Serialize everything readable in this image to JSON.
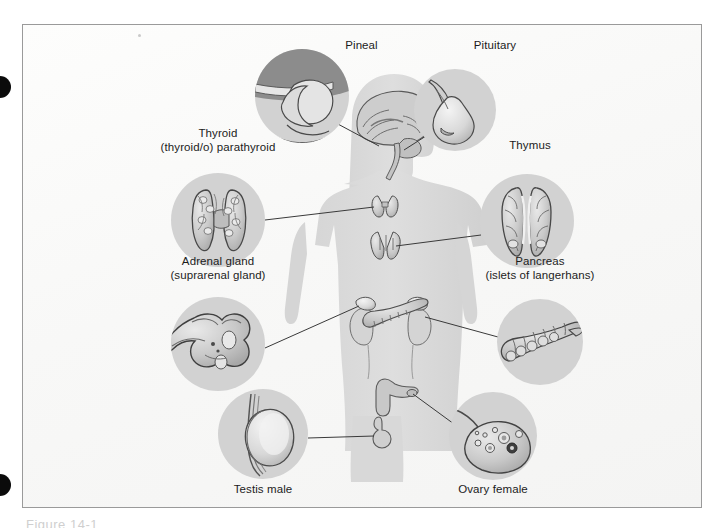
{
  "figure": {
    "bottom_caption_partial": "Figure 14-1",
    "background_color": "#fbfbfa",
    "frame_border_color": "#9a9a9a",
    "body_silhouette_color": "#dcdcdc",
    "callout_circle_color": "#d2d2d2",
    "callout_circle_dark_color": "#8c8c8c",
    "leader_line_color": "#3a3a3a",
    "organ_fill_color": "#c6c6c6",
    "organ_outline_color": "#4a4a4a",
    "label_text_color": "#1c1c1c"
  },
  "labels": [
    {
      "id": "pineal",
      "name": "Pineal",
      "sub": ""
    },
    {
      "id": "pituitary",
      "name": "Pituitary",
      "sub": ""
    },
    {
      "id": "thyroid",
      "name": "Thyroid",
      "sub": "(thyroid/o) parathyroid"
    },
    {
      "id": "thymus",
      "name": "Thymus",
      "sub": ""
    },
    {
      "id": "adrenal",
      "name": "Adrenal gland",
      "sub": "(suprarenal gland)"
    },
    {
      "id": "pancreas",
      "name": "Pancreas",
      "sub": "(islets of langerhans)"
    },
    {
      "id": "testis",
      "name": "Testis male",
      "sub": ""
    },
    {
      "id": "ovary",
      "name": "Ovary female",
      "sub": ""
    }
  ],
  "callouts": {
    "pineal": {
      "label": "Pineal",
      "sublabel": "",
      "cx": 280,
      "cy": 72,
      "r": 47
    },
    "pituitary": {
      "label": "Pituitary",
      "sublabel": "",
      "cx": 433,
      "cy": 86,
      "r": 41
    },
    "thyroid": {
      "label": "Thyroid",
      "sublabel": "(thyroid/o) parathyroid",
      "cx": 196,
      "cy": 196,
      "r": 47
    },
    "thymus": {
      "label": "Thymus",
      "sublabel": "",
      "cx": 505,
      "cy": 197,
      "r": 47
    },
    "adrenal": {
      "label": "Adrenal gland",
      "sublabel": "(suprarenal gland)",
      "cx": 196,
      "cy": 320,
      "r": 47
    },
    "pancreas": {
      "label": "Pancreas",
      "sublabel": "(islets of langerhans)",
      "cx": 518,
      "cy": 318,
      "r": 43
    },
    "testis": {
      "label": "Testis male",
      "sublabel": "",
      "cx": 241,
      "cy": 410,
      "r": 45
    },
    "ovary": {
      "label": "Ovary female",
      "sublabel": "",
      "cx": 471,
      "cy": 412,
      "r": 44
    }
  },
  "anatomy_markers": [
    {
      "id": "brain",
      "organ": "brain-sagittal",
      "x": 357,
      "y": 122
    },
    {
      "id": "thyroid",
      "organ": "thyroid-gland",
      "x": 363,
      "y": 180
    },
    {
      "id": "thymus",
      "organ": "thymus-gland",
      "x": 363,
      "y": 218
    },
    {
      "id": "adrenals",
      "organ": "adrenal-on-kidneys",
      "x": 355,
      "y": 290
    },
    {
      "id": "pancreas",
      "organ": "pancreas-organ",
      "x": 378,
      "y": 297
    },
    {
      "id": "uterus",
      "organ": "uterus-ovary",
      "x": 374,
      "y": 368
    },
    {
      "id": "testis",
      "organ": "testis-organ",
      "x": 358,
      "y": 404
    }
  ]
}
